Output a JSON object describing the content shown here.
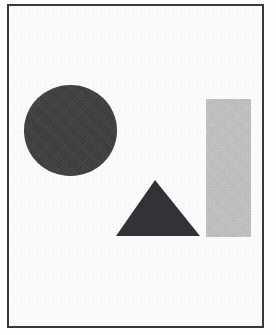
{
  "figure": {
    "canvas": {
      "width": 276,
      "height": 335,
      "background_color": "#ffffff",
      "paper_color": "#fbfbfb"
    },
    "frame": {
      "name": "border-frame",
      "left": 7,
      "top": 4,
      "width": 257,
      "height": 324,
      "border_width": 2,
      "border_color": "#3a3a3a"
    },
    "shapes": [
      {
        "id": "circle",
        "label": "Circle",
        "kind": "circle",
        "fill_color": "#3f3f40",
        "left": 24,
        "top": 85,
        "width": 93,
        "height": 91,
        "center_x": 70,
        "center_y": 130,
        "radius": 46
      },
      {
        "id": "triangle",
        "label": "Triangle",
        "kind": "triangle",
        "fill_color": "#333335",
        "left": 116,
        "top": 180,
        "width": 85,
        "height": 57,
        "apex_x": 155,
        "apex_y": 180,
        "base_left_x": 116,
        "base_right_x": 200,
        "base_y": 236
      },
      {
        "id": "rectangle",
        "label": "Rectangle",
        "kind": "rectangle",
        "fill_color": "#c2c2c2",
        "left": 206,
        "top": 99,
        "width": 45,
        "height": 138
      }
    ]
  }
}
